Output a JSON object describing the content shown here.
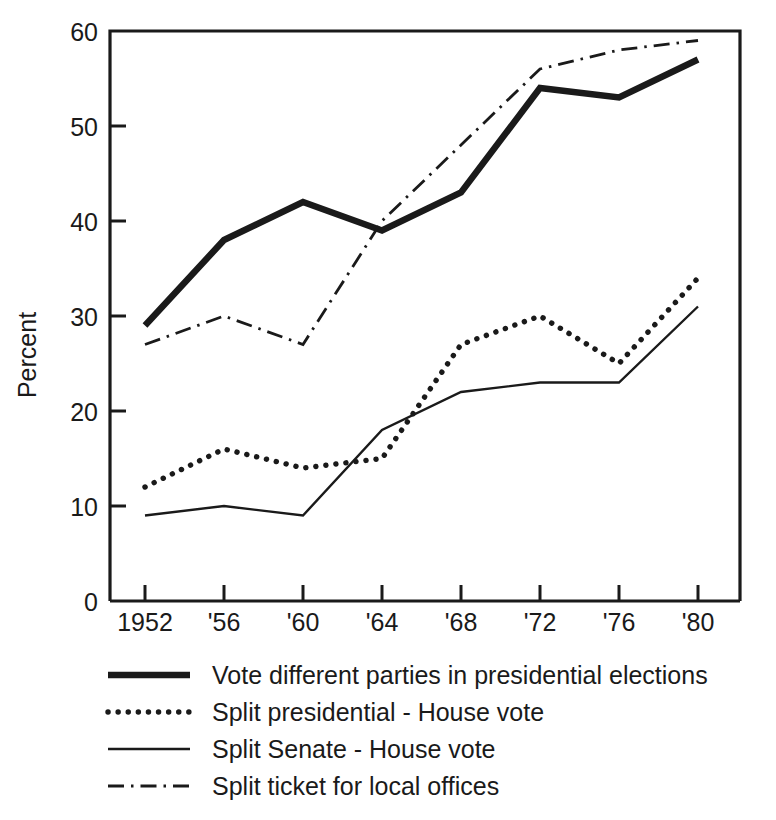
{
  "chart_data": {
    "type": "line",
    "title": "",
    "subtitle": "",
    "xlabel": "",
    "ylabel": "Percent",
    "x": [
      1952,
      1956,
      1960,
      1964,
      1968,
      1972,
      1976,
      1980
    ],
    "categories": [
      "1952",
      "'56",
      "'60",
      "'64",
      "'68",
      "'72",
      "'76",
      "'80"
    ],
    "xtick_labels": [
      "1952",
      "'56",
      "'60",
      "'64",
      "'68",
      "'72",
      "'76",
      "'80"
    ],
    "ytick_labels": [
      "0",
      "10",
      "20",
      "30",
      "40",
      "50",
      "60"
    ],
    "ytick_values": [
      0,
      10,
      20,
      30,
      40,
      50,
      60
    ],
    "ylim": [
      0,
      60
    ],
    "xlim": [
      1950,
      1982
    ],
    "grid": false,
    "legend_position": "bottom",
    "series": [
      {
        "name": "Vote different parties in presidential elections",
        "style": "solid-thick",
        "values": [
          29,
          38,
          42,
          39,
          43,
          54,
          53,
          57
        ]
      },
      {
        "name": "Split presidential - House vote",
        "style": "dotted",
        "values": [
          12,
          16,
          14,
          15,
          27,
          30,
          25,
          34
        ]
      },
      {
        "name": "Split Senate - House vote",
        "style": "solid-thin",
        "values": [
          9,
          10,
          9,
          18,
          22,
          23,
          23,
          31
        ]
      },
      {
        "name": "Split ticket for local offices",
        "style": "dash-dot",
        "values": [
          27,
          30,
          27,
          40,
          48,
          56,
          58,
          59
        ]
      }
    ]
  },
  "axis": {
    "y_title": "Percent",
    "y_ticks": [
      "60",
      "50",
      "40",
      "30",
      "20",
      "10",
      "0"
    ],
    "x_ticks": [
      "1952",
      "'56",
      "'60",
      "'64",
      "'68",
      "'72",
      "'76",
      "'80"
    ]
  },
  "legend": {
    "entries": [
      {
        "label": "Vote different parties in presidential elections",
        "style": "solid-thick"
      },
      {
        "label": "Split presidential - House vote",
        "style": "dotted"
      },
      {
        "label": "Split Senate - House vote",
        "style": "solid-thin"
      },
      {
        "label": "Split ticket for local offices",
        "style": "dash-dot"
      }
    ]
  },
  "colors": {
    "ink": "#1a1a1a",
    "background": "#ffffff"
  }
}
